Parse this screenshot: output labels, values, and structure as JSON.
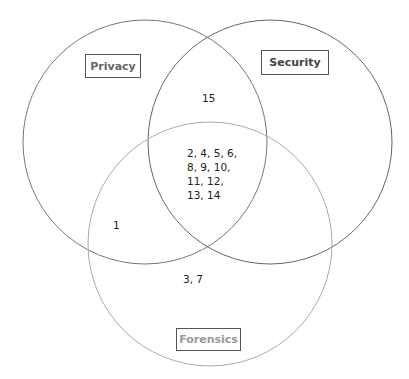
{
  "diagram": {
    "type": "venn-3",
    "sets": [
      {
        "name": "Privacy",
        "color": "#777777",
        "label_color": "#666666"
      },
      {
        "name": "Security",
        "color": "#666666",
        "label_color": "#444444"
      },
      {
        "name": "Forensics",
        "color": "#aaaaaa",
        "label_color": "#999999"
      }
    ],
    "regions": {
      "privacy_security_only": "15",
      "all_three_lines": [
        "2, 4, 5, 6,",
        "8, 9, 10,",
        "11, 12,",
        "13, 14"
      ],
      "privacy_forensics_only": "1",
      "forensics_only": "3, 7"
    }
  }
}
